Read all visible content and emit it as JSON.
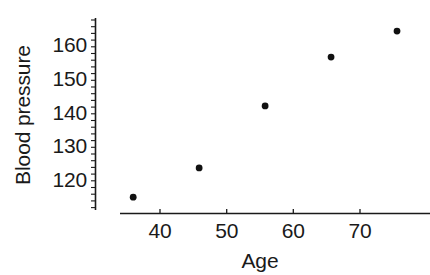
{
  "chart_data": {
    "type": "scatter",
    "title": "",
    "xlabel": "Age",
    "ylabel": "Blood pressure",
    "x": [
      35,
      45,
      55,
      65,
      75
    ],
    "y": [
      115,
      124,
      143,
      158,
      166
    ],
    "series": [
      {
        "name": "",
        "points": [
          {
            "x": 35,
            "y": 115
          },
          {
            "x": 45,
            "y": 124
          },
          {
            "x": 55,
            "y": 143
          },
          {
            "x": 65,
            "y": 158
          },
          {
            "x": 75,
            "y": 166
          }
        ]
      }
    ],
    "xlim": [
      33,
      80
    ],
    "ylim": [
      110,
      170
    ],
    "xticks": [
      40,
      50,
      60,
      70
    ],
    "xtick_labels": [
      "40",
      "50",
      "60",
      "70"
    ],
    "yticks": [
      120,
      130,
      140,
      150,
      160
    ],
    "ytick_labels": [
      "120",
      "130",
      "140",
      "150",
      "160"
    ],
    "y_minor_tick_step": 2,
    "grid": false,
    "legend": null,
    "marker": "filled-circle",
    "marker_color": "#111111",
    "axis_color": "#1a1a1a",
    "background_color": "#ffffff",
    "axis_style": "detached-offset-spines"
  },
  "labels": {
    "y_axis_title": "Blood pressure",
    "x_axis_title": "Age",
    "y_tick_160": "160",
    "y_tick_150": "150",
    "y_tick_140": "140",
    "y_tick_130": "130",
    "y_tick_120": "120",
    "x_tick_40": "40",
    "x_tick_50": "50",
    "x_tick_60": "60",
    "x_tick_70": "70"
  }
}
